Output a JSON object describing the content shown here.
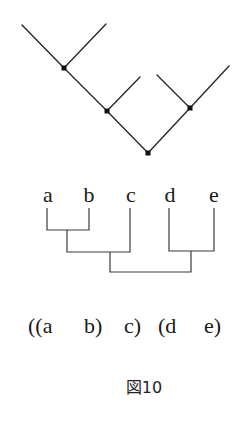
{
  "diagram": {
    "type": "phylogenetic-tree",
    "tree": {
      "nodes": [
        {
          "id": "n1",
          "x": 64,
          "y": 68
        },
        {
          "id": "n2",
          "x": 107,
          "y": 111
        },
        {
          "id": "n3",
          "x": 190,
          "y": 108
        },
        {
          "id": "root",
          "x": 148,
          "y": 153
        }
      ],
      "edges": [
        {
          "from": [
            22,
            25
          ],
          "to": [
            64,
            68
          ]
        },
        {
          "from": [
            106,
            24
          ],
          "to": [
            64,
            68
          ]
        },
        {
          "from": [
            64,
            68
          ],
          "to": [
            107,
            111
          ]
        },
        {
          "from": [
            140,
            77
          ],
          "to": [
            107,
            111
          ]
        },
        {
          "from": [
            107,
            111
          ],
          "to": [
            148,
            153
          ]
        },
        {
          "from": [
            157,
            75
          ],
          "to": [
            190,
            108
          ]
        },
        {
          "from": [
            229,
            66
          ],
          "to": [
            190,
            108
          ]
        },
        {
          "from": [
            190,
            108
          ],
          "to": [
            148,
            153
          ]
        }
      ]
    },
    "cladogram": {
      "leaves": [
        {
          "label": "a",
          "x": 47
        },
        {
          "label": "b",
          "x": 89
        },
        {
          "label": "c",
          "x": 130
        },
        {
          "label": "d",
          "x": 169
        },
        {
          "label": "e",
          "x": 214
        }
      ]
    },
    "newick": {
      "tokens": [
        "((a",
        "b)",
        "c)",
        "(d",
        "e)"
      ]
    },
    "caption": "図10"
  }
}
